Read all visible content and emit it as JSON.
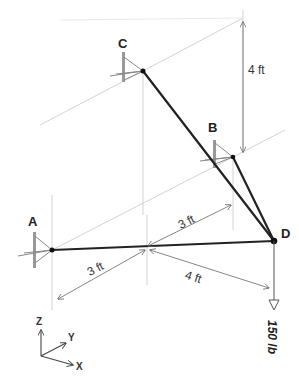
{
  "diagram": {
    "title_partial": "",
    "points": {
      "A": {
        "label": "A"
      },
      "B": {
        "label": "B"
      },
      "C": {
        "label": "C"
      },
      "D": {
        "label": "D"
      }
    },
    "dimensions": {
      "vertical_c": "4 ft",
      "ab_y": "3 ft",
      "a_x": "3 ft",
      "d_x": "4 ft"
    },
    "load": {
      "label": "150 lb"
    },
    "axes": {
      "z": "Z",
      "y": "Y",
      "x": "X"
    },
    "colors": {
      "member": "#222222",
      "construction": "#bdbdbd",
      "dimension": "#777777",
      "support": "#888888"
    }
  }
}
